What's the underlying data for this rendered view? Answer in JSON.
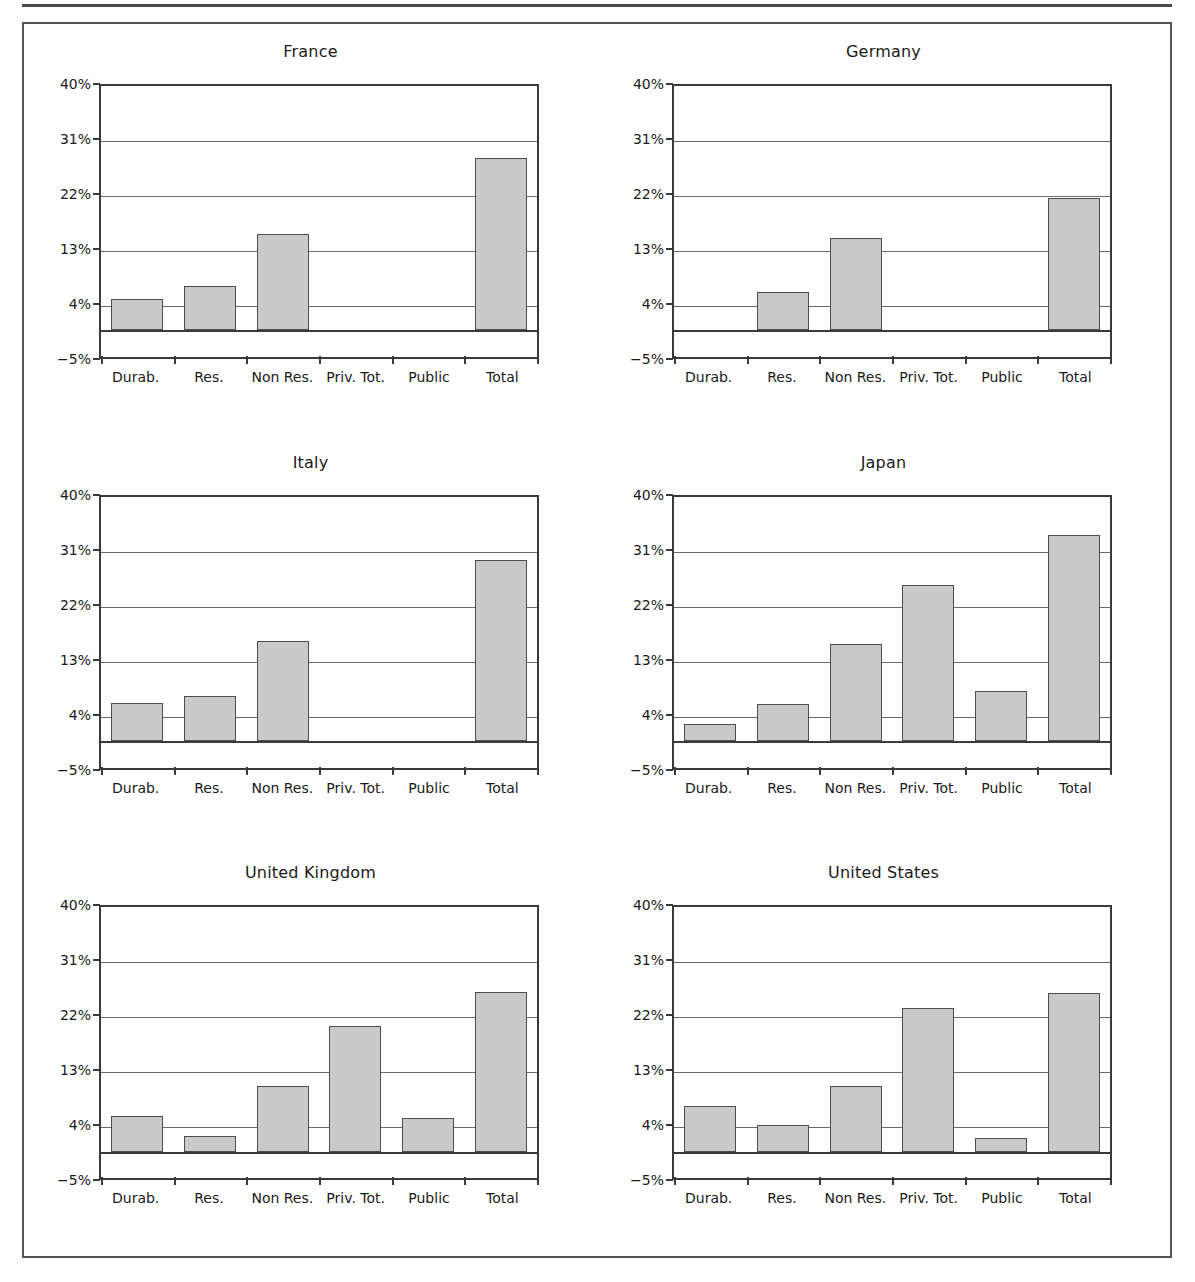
{
  "figure": {
    "panel_order": [
      "france",
      "germany",
      "italy",
      "japan",
      "united_kingdom",
      "united_states"
    ]
  },
  "axis": {
    "y_ticks": [
      {
        "value": 40,
        "label": "40%"
      },
      {
        "value": 31,
        "label": "31%"
      },
      {
        "value": 22,
        "label": "22%"
      },
      {
        "value": 13,
        "label": "13%"
      },
      {
        "value": 4,
        "label": "4%"
      },
      {
        "value": -5,
        "label": "−5%"
      }
    ],
    "categories": [
      "Durab.",
      "Res.",
      "Non Res.",
      "Priv. Tot.",
      "Public",
      "Total"
    ],
    "ymin": -5,
    "ymax": 40,
    "zero_line": 0
  },
  "chart_data": [
    {
      "type": "bar",
      "title": "France",
      "xlabel": "",
      "ylabel": "",
      "ylim": [
        -5,
        40
      ],
      "grid": true,
      "legend": "none",
      "categories": [
        "Durab.",
        "Res.",
        "Non Res.",
        "Priv. Tot.",
        "Public",
        "Total"
      ],
      "values": [
        5.2,
        7.2,
        15.8,
        null,
        null,
        28.2
      ]
    },
    {
      "type": "bar",
      "title": "Germany",
      "xlabel": "",
      "ylabel": "",
      "ylim": [
        -5,
        40
      ],
      "grid": true,
      "legend": "none",
      "categories": [
        "Durab.",
        "Res.",
        "Non Res.",
        "Priv. Tot.",
        "Public",
        "Total"
      ],
      "values": [
        null,
        6.3,
        15.2,
        null,
        null,
        21.7
      ]
    },
    {
      "type": "bar",
      "title": "Italy",
      "xlabel": "",
      "ylabel": "",
      "ylim": [
        -5,
        40
      ],
      "grid": true,
      "legend": "none",
      "categories": [
        "Durab.",
        "Res.",
        "Non Res.",
        "Priv. Tot.",
        "Public",
        "Total"
      ],
      "values": [
        6.3,
        7.4,
        16.3,
        null,
        null,
        29.7
      ]
    },
    {
      "type": "bar",
      "title": "Japan",
      "xlabel": "",
      "ylabel": "",
      "ylim": [
        -5,
        40
      ],
      "grid": true,
      "legend": "none",
      "categories": [
        "Durab.",
        "Res.",
        "Non Res.",
        "Priv. Tot.",
        "Public",
        "Total"
      ],
      "values": [
        2.8,
        6.1,
        15.9,
        25.5,
        8.2,
        33.8
      ]
    },
    {
      "type": "bar",
      "title": "United Kingdom",
      "xlabel": "",
      "ylabel": "",
      "ylim": [
        -5,
        40
      ],
      "grid": true,
      "legend": "none",
      "categories": [
        "Durab.",
        "Res.",
        "Non Res.",
        "Priv. Tot.",
        "Public",
        "Total"
      ],
      "values": [
        5.8,
        2.5,
        10.7,
        20.5,
        5.5,
        26.1
      ]
    },
    {
      "type": "bar",
      "title": "United States",
      "xlabel": "",
      "ylabel": "",
      "ylim": [
        -5,
        40
      ],
      "grid": true,
      "legend": "none",
      "categories": [
        "Durab.",
        "Res.",
        "Non Res.",
        "Priv. Tot.",
        "Public",
        "Total"
      ],
      "values": [
        7.5,
        4.3,
        10.8,
        23.6,
        2.2,
        25.9
      ]
    }
  ],
  "colors": {
    "bar_fill": "#c9c9c9",
    "bar_stroke": "#4d4d4d",
    "axis": "#3a3a3a",
    "gridline": "#6b6b6b",
    "frame": "#555555",
    "text": "#1a1a1a"
  }
}
